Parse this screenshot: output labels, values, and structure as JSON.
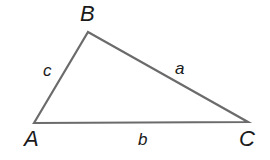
{
  "diagram": {
    "type": "triangle",
    "stroke_color": "#6b6b6b",
    "vertices": [
      {
        "id": "A",
        "label": "A",
        "x": 34,
        "y": 123
      },
      {
        "id": "B",
        "label": "B",
        "x": 88,
        "y": 32
      },
      {
        "id": "C",
        "label": "C",
        "x": 248,
        "y": 122
      }
    ],
    "sides": [
      {
        "id": "a",
        "label": "a",
        "from": "B",
        "to": "C"
      },
      {
        "id": "b",
        "label": "b",
        "from": "A",
        "to": "C"
      },
      {
        "id": "c",
        "label": "c",
        "from": "A",
        "to": "B"
      }
    ]
  }
}
